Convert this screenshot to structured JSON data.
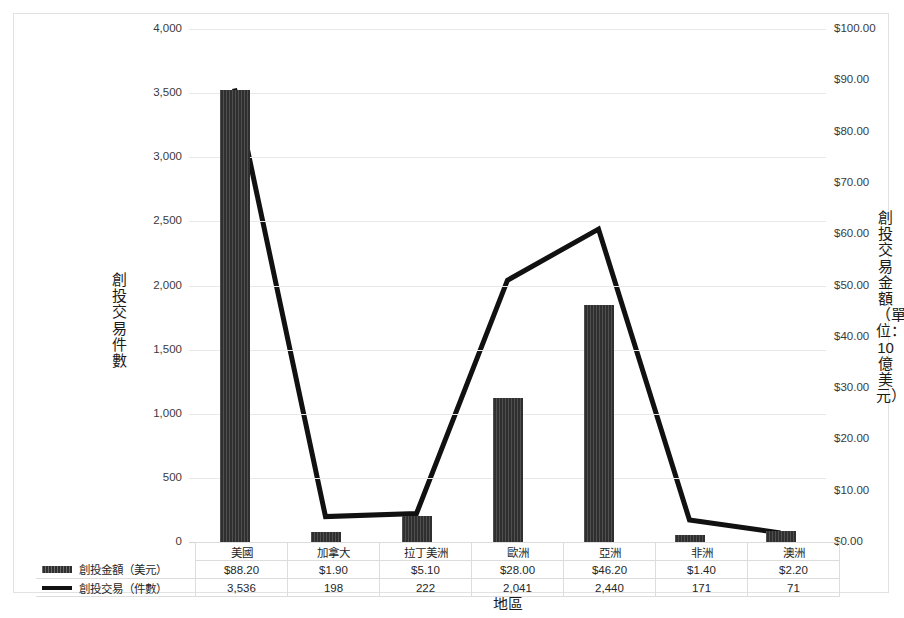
{
  "chart_data": {
    "type": "bar",
    "title": "",
    "xlabel": "地區",
    "categories": [
      "美國",
      "加拿大",
      "拉丁美洲",
      "歐洲",
      "亞洲",
      "非洲",
      "澳洲"
    ],
    "series": [
      {
        "name": "創投金額（美元）",
        "type": "bar",
        "axis": "right",
        "values": [
          88.2,
          1.9,
          5.1,
          28.0,
          46.2,
          1.4,
          2.2
        ],
        "display_values": [
          "$88.20",
          "$1.90",
          "$5.10",
          "$28.00",
          "$46.20",
          "$1.40",
          "$2.20"
        ],
        "color": "#2f2f2f"
      },
      {
        "name": "創投交易（件數）",
        "type": "line",
        "axis": "left",
        "values": [
          3536,
          198,
          222,
          2041,
          2440,
          171,
          71
        ],
        "display_values": [
          "3,536",
          "198",
          "222",
          "2,041",
          "2,440",
          "171",
          "71"
        ],
        "color": "#111111"
      }
    ],
    "y_left": {
      "label": "創投交易件數",
      "ticks": [
        0,
        500,
        1000,
        1500,
        2000,
        2500,
        3000,
        3500,
        4000
      ],
      "tick_labels": [
        "0",
        "500",
        "1,000",
        "1,500",
        "2,000",
        "2,500",
        "3,000",
        "3,500",
        "4,000"
      ],
      "ylim": [
        0,
        4000
      ]
    },
    "y_right": {
      "label": "創投交易金額（單位：10億美元）",
      "ticks": [
        0,
        10,
        20,
        30,
        40,
        50,
        60,
        70,
        80,
        90,
        100
      ],
      "tick_labels": [
        "$0.00",
        "$10.00",
        "$20.00",
        "$30.00",
        "$40.00",
        "$50.00",
        "$60.00",
        "$70.00",
        "$80.00",
        "$90.00",
        "$100.00"
      ],
      "ylim": [
        0,
        100
      ]
    },
    "grid": true,
    "legend_position": "data-table-left"
  },
  "table": {
    "rows": [
      {
        "legend_label": "創投金額（美元）",
        "swatch": "bar-swatch",
        "cells": [
          "$88.20",
          "$1.90",
          "$5.10",
          "$28.00",
          "$46.20",
          "$1.40",
          "$2.20"
        ]
      },
      {
        "legend_label": "創投交易（件數）",
        "swatch": "line-swatch",
        "cells": [
          "3,536",
          "198",
          "222",
          "2,041",
          "2,440",
          "171",
          "71"
        ]
      }
    ]
  }
}
